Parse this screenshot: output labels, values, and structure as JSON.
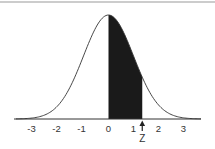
{
  "chart_data": {
    "type": "area",
    "title": "",
    "xlabel": "",
    "ylabel": "",
    "xlim": [
      -3.7,
      3.7
    ],
    "x_ticks": [
      -3,
      -2,
      -1,
      0,
      1,
      2,
      3
    ],
    "tick_labels": [
      "-3",
      "-2",
      "-1",
      "0",
      "1",
      "2",
      "3"
    ],
    "curve": "standard normal pdf",
    "shaded_region": {
      "from": 0,
      "to": 1.35
    },
    "marker": {
      "label": "Z",
      "x": 1.35,
      "symbol": "up-arrow"
    },
    "grid": false,
    "legend": null,
    "colors": {
      "curve": "#333333",
      "shade": "#1a1a1a",
      "axis": "#333333",
      "border": "#bbbbbb"
    }
  },
  "marker_label": "Z",
  "ticks": [
    "-3",
    "-2",
    "-1",
    "0",
    "1",
    "2",
    "3"
  ]
}
